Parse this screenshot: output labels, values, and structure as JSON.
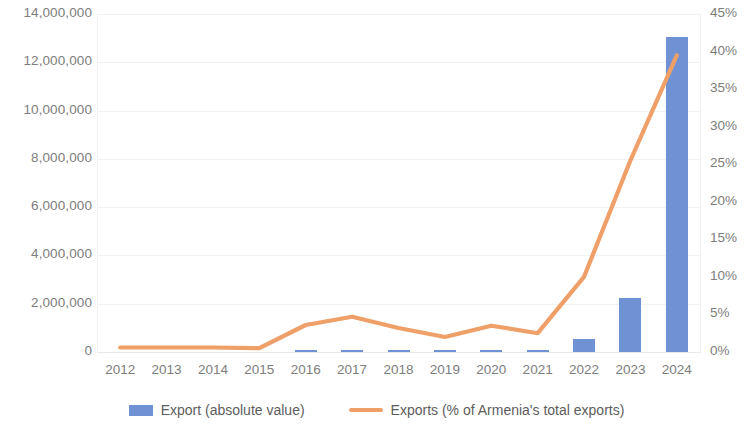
{
  "chart_data": {
    "type": "bar",
    "title": "",
    "subtitle": "",
    "xlabel": "",
    "ylabel": "",
    "categories": [
      "2012",
      "2013",
      "2014",
      "2015",
      "2016",
      "2017",
      "2018",
      "2019",
      "2020",
      "2021",
      "2022",
      "2023",
      "2024"
    ],
    "grid": false,
    "legend_position": "bottom",
    "series": [
      {
        "name": "Export (absolute value)",
        "type": "bar",
        "axis": "left",
        "color": "#6f92d4",
        "values": [
          0,
          0,
          0,
          0,
          20000,
          30000,
          20000,
          20000,
          30000,
          20000,
          520000,
          2250000,
          13050000
        ]
      },
      {
        "name": "Exports (% of Armenia's total exports)",
        "type": "line",
        "axis": "right",
        "color": "#ef9f68",
        "values": [
          0.6,
          0.6,
          0.6,
          0.5,
          3.6,
          4.7,
          3.2,
          2.0,
          3.5,
          2.5,
          10.0,
          25.5,
          39.5
        ]
      }
    ],
    "left_axis": {
      "ticks": [
        "0",
        "2,000,000",
        "4,000,000",
        "6,000,000",
        "8,000,000",
        "10,000,000",
        "12,000,000",
        "14,000,000"
      ],
      "values": [
        0,
        2000000,
        4000000,
        6000000,
        8000000,
        10000000,
        12000000,
        14000000
      ],
      "min": 0,
      "max": 14000000
    },
    "right_axis": {
      "ticks": [
        "0%",
        "5%",
        "10%",
        "15%",
        "20%",
        "25%",
        "30%",
        "35%",
        "40%",
        "45%"
      ],
      "values": [
        0,
        5,
        10,
        15,
        20,
        25,
        30,
        35,
        40,
        45
      ],
      "min": 0,
      "max": 45
    }
  },
  "legend": {
    "items": [
      {
        "label": "Export (absolute value)",
        "marker": "bar-swatch-icon",
        "color": "#6f92d4"
      },
      {
        "label": "Exports (% of Armenia's total exports)",
        "marker": "line-swatch-icon",
        "color": "#ef9f68"
      }
    ]
  }
}
